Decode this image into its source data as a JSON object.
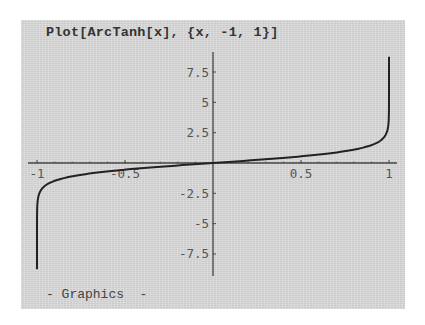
{
  "cell": {
    "input": "Plot[ArcTanh[x], {x, -1, 1}]",
    "output_label": "- Graphics  -"
  },
  "colors": {
    "background": "#d9d9d9",
    "curve": "#222222",
    "axes": "#444444"
  },
  "chart_data": {
    "type": "line",
    "title": "Plot[ArcTanh[x], {x, -1, 1}]",
    "function": "ArcTanh[x]",
    "xlabel": "",
    "ylabel": "",
    "xlim": [
      -1,
      1
    ],
    "ylim": [
      -8.8,
      8.7
    ],
    "grid": false,
    "legend": null,
    "x_ticks": [
      -1,
      -0.5,
      0.5,
      1
    ],
    "x_tick_labels": [
      "-1",
      "-0.5",
      "0.5",
      "1"
    ],
    "y_ticks": [
      -7.5,
      -5,
      -2.5,
      2.5,
      5,
      7.5
    ],
    "y_tick_labels": [
      "-7.5",
      "-5",
      "-2.5",
      "2.5",
      "5",
      "7.5"
    ],
    "series": [
      {
        "name": "ArcTanh[x]",
        "x": [
          -0.99999997,
          -0.9999,
          -0.999,
          -0.99,
          -0.95,
          -0.9,
          -0.8,
          -0.6,
          -0.4,
          -0.2,
          0,
          0.2,
          0.4,
          0.6,
          0.8,
          0.9,
          0.95,
          0.99,
          0.999,
          0.9999,
          0.99999997
        ],
        "y": [
          -8.75,
          -4.95,
          -3.8,
          -2.65,
          -1.83,
          -1.47,
          -1.1,
          -0.69,
          -0.42,
          -0.2,
          0,
          0.2,
          0.42,
          0.69,
          1.1,
          1.47,
          1.83,
          2.65,
          3.8,
          4.95,
          8.75
        ]
      }
    ]
  }
}
